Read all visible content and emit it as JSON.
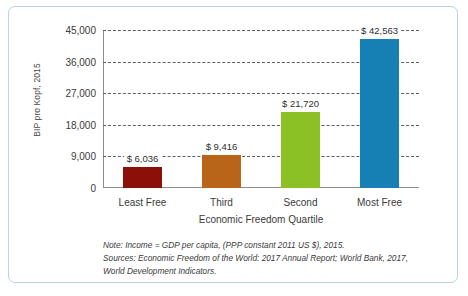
{
  "figure": {
    "frame_border_color": "#b9d4e2",
    "background_color": "#ffffff"
  },
  "caption": {
    "line1": "Note: Income = GDP per capita, (PPP constant 2011 US $), 2015.",
    "line2": "Sources: Economic Freedom of the World: 2017 Annual Report; World Bank, 2017,",
    "line3": "World Development Indicators."
  },
  "chart_data": {
    "type": "bar",
    "title": "",
    "xlabel": "Economic Freedom Quartile",
    "ylabel": "BIP pro Kopf, 2015",
    "categories": [
      "Least Free",
      "Third",
      "Second",
      "Most Free"
    ],
    "values": [
      6036,
      9416,
      21720,
      42563
    ],
    "value_labels": [
      "$ 6,036",
      "$ 9,416",
      "$ 21,720",
      "$ 42,563"
    ],
    "colors": [
      "#8B1008",
      "#B8651A",
      "#8CC126",
      "#1680B4"
    ],
    "ylim": [
      0,
      45000
    ],
    "yticks": [
      0,
      9000,
      18000,
      27000,
      36000,
      45000
    ],
    "ytick_labels": [
      "0",
      "9,000",
      "18,000",
      "27,000",
      "36,000",
      "45,000"
    ],
    "grid": true,
    "grid_style": "dashed-horizontal",
    "legend": "none"
  }
}
